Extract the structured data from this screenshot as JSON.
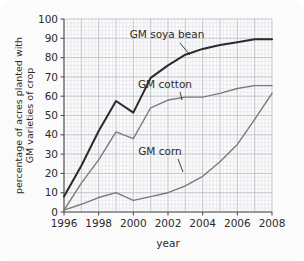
{
  "chart_data": {
    "type": "line",
    "title": "",
    "xlabel": "year",
    "ylabel": "percentage of acres planted with GM varieties of crop",
    "ylabel_line1": "percentage of acres planted with",
    "ylabel_line2": "GM varieties of crop",
    "xlim": [
      1996,
      2008
    ],
    "ylim": [
      0,
      100
    ],
    "grid": true,
    "legend_position": "inline-annotations",
    "x": [
      1996,
      1997,
      1998,
      1999,
      2000,
      2001,
      2002,
      2003,
      2004,
      2005,
      2006,
      2007,
      2008
    ],
    "xticks": [
      1996,
      1998,
      2000,
      2002,
      2004,
      2006,
      2008
    ],
    "xtick_labels": [
      "1996",
      "1998",
      "2000",
      "2002",
      "2004",
      "2006",
      "2008"
    ],
    "yticks": [
      0,
      10,
      20,
      30,
      40,
      50,
      60,
      70,
      80,
      90,
      100
    ],
    "ytick_labels": [
      "0",
      "10",
      "20",
      "30",
      "40",
      "50",
      "60",
      "70",
      "80",
      "90",
      "100"
    ],
    "series": [
      {
        "name": "GM soya bean",
        "color": "#2a2a2a",
        "width": 2.0,
        "values": [
          8,
          24,
          42,
          57.5,
          51.5,
          69.5,
          76,
          81.5,
          84.5,
          86.5,
          88,
          89.5,
          89.5
        ],
        "annotation": {
          "label": "GM soya bean",
          "text_x": 167,
          "text_y": 38,
          "leader_from_x": 180,
          "leader_from_y": 43,
          "leader_to_x": 190,
          "leader_to_y": 55
        }
      },
      {
        "name": "GM cotton",
        "color": "#7a7a7a",
        "width": 1.4,
        "values": [
          1,
          15,
          27,
          41.5,
          38,
          54,
          58,
          59.5,
          59.5,
          61.5,
          64,
          65.5,
          65.5
        ],
        "annotation": {
          "label": "GM cotton",
          "text_x": 165,
          "text_y": 88,
          "leader_from_x": 180,
          "leader_from_y": 92,
          "leader_to_x": 182,
          "leader_to_y": 100
        }
      },
      {
        "name": "GM corn",
        "color": "#7a7a7a",
        "width": 1.4,
        "values": [
          1,
          4,
          7.5,
          10,
          6,
          8,
          10,
          13.5,
          18.5,
          26,
          35,
          48,
          61.5
        ],
        "annotation": {
          "label": "GM corn",
          "text_x": 160,
          "text_y": 155,
          "leader_from_x": 178,
          "leader_from_y": 159,
          "leader_to_x": 183,
          "leader_to_y": 172
        }
      }
    ]
  },
  "colors": {
    "page_background": "#ffffff",
    "card_background": "#fbfbfb",
    "axis": "#555555",
    "grid_major": "#b9b9c4",
    "grid_minor": "#dedee6",
    "text": "#2b2b2b",
    "soya_line": "#2a2a2a",
    "cotton_line": "#7a7a7a",
    "corn_line": "#7a7a7a"
  }
}
